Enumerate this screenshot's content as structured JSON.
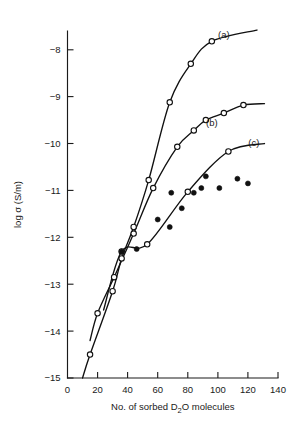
{
  "chart_data": {
    "type": "line",
    "title": "",
    "xlabel": "No. of sorbed D₂O molecules",
    "ylabel": "log σ (S/m)",
    "xlim": [
      0,
      140
    ],
    "ylim": [
      -15,
      -7.6
    ],
    "xticks": [
      0,
      20,
      40,
      60,
      80,
      100,
      120,
      140
    ],
    "yticks": [
      -15,
      -14,
      -13,
      -12,
      -11,
      -10,
      -9,
      -8
    ],
    "xtick_labels": [
      "0",
      "20",
      "40",
      "60",
      "80",
      "100",
      "120",
      "140"
    ],
    "ytick_labels": [
      "−15",
      "−14",
      "−13",
      "−12",
      "−11",
      "−10",
      "−9",
      "−8"
    ],
    "grid": false,
    "legend_position": "inline-annotations",
    "annotations": [
      {
        "text": "(a)",
        "x": 104,
        "y": -7.75
      },
      {
        "text": "(b)",
        "x": 96,
        "y": -9.62
      },
      {
        "text": "(c)",
        "x": 124,
        "y": -10.05
      }
    ],
    "series": [
      {
        "name": "(a)",
        "marker": "open-circle",
        "line": true,
        "points": [
          {
            "x": 15,
            "y": -14.5
          },
          {
            "x": 30,
            "y": -13.15
          },
          {
            "x": 36,
            "y": -12.45
          },
          {
            "x": 44,
            "y": -11.78
          },
          {
            "x": 54,
            "y": -10.78
          },
          {
            "x": 68,
            "y": -9.12
          },
          {
            "x": 82,
            "y": -8.3
          },
          {
            "x": 96,
            "y": -7.82
          }
        ],
        "curve_start": {
          "x": 10,
          "y": -15.0
        },
        "curve_end": {
          "x": 126,
          "y": -7.58
        }
      },
      {
        "name": "(b)",
        "marker": "open-circle",
        "line": true,
        "points": [
          {
            "x": 20,
            "y": -13.62
          },
          {
            "x": 31,
            "y": -12.85
          },
          {
            "x": 44,
            "y": -11.92
          },
          {
            "x": 57,
            "y": -10.95
          },
          {
            "x": 73,
            "y": -10.07
          },
          {
            "x": 84,
            "y": -9.72
          },
          {
            "x": 92,
            "y": -9.5
          },
          {
            "x": 104,
            "y": -9.35
          },
          {
            "x": 117,
            "y": -9.18
          }
        ],
        "curve_start": {
          "x": 15,
          "y": -14.2
        },
        "curve_end": {
          "x": 131,
          "y": -9.15
        }
      },
      {
        "name": "(c)",
        "marker": "open-circle",
        "line": true,
        "points": [
          {
            "x": 36,
            "y": -12.3
          },
          {
            "x": 53,
            "y": -12.15
          },
          {
            "x": 80,
            "y": -11.03
          },
          {
            "x": 107,
            "y": -10.17
          }
        ],
        "curve_start": {
          "x": 24,
          "y": -13.55
        },
        "curve_end": {
          "x": 131,
          "y": -10.0
        }
      },
      {
        "name": "filled-data",
        "marker": "filled-circle",
        "line": false,
        "points": [
          {
            "x": 36,
            "y": -12.3
          },
          {
            "x": 46,
            "y": -12.25
          },
          {
            "x": 60,
            "y": -11.62
          },
          {
            "x": 68,
            "y": -11.78
          },
          {
            "x": 69,
            "y": -11.05
          },
          {
            "x": 76,
            "y": -11.38
          },
          {
            "x": 84,
            "y": -11.05
          },
          {
            "x": 89,
            "y": -10.95
          },
          {
            "x": 92,
            "y": -10.7
          },
          {
            "x": 101,
            "y": -10.95
          },
          {
            "x": 113,
            "y": -10.75
          },
          {
            "x": 120,
            "y": -10.85
          }
        ]
      }
    ]
  }
}
